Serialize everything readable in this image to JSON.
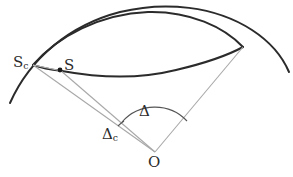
{
  "figure": {
    "background_color": "#ffffff",
    "width": 293,
    "height": 177,
    "colors": {
      "dark_stroke": "#2b2b2b",
      "light_stroke": "#a8a8a8",
      "label_color": "#2b2b2b",
      "point_fill": "#1a1a1a"
    },
    "labels": {
      "source_corrected": {
        "base": "S",
        "sub": "c",
        "name": "S_c"
      },
      "source": {
        "base": "S",
        "sub": "",
        "name": "S"
      },
      "origin": {
        "base": "O",
        "sub": "",
        "name": "O"
      },
      "angle_delta": {
        "base": "Δ",
        "sub": "",
        "name": "Delta"
      },
      "angle_delta_c": {
        "base": "Δ",
        "sub": "c",
        "name": "Delta_c"
      }
    },
    "points": [
      {
        "name": "S",
        "x": 60,
        "y": 70
      },
      {
        "name": "O",
        "x": 155,
        "y": 152
      },
      {
        "name": "S_c",
        "x": 33,
        "y": 65
      },
      {
        "name": "R",
        "x": 243,
        "y": 47
      }
    ],
    "geometry": {
      "big_arc": "large circle arc spanning left to right across the upper field",
      "lens_upper_arc": "upper boundary of lens (vesica) shape",
      "lens_lower_arc": "lower boundary of lens passing through point S",
      "ray_to_Sc": "light ray from O to S_c",
      "ray_to_S": "light ray from O to S",
      "ray_to_right": "light ray from O to right arc intersection",
      "angle_arc_delta": "arc marking angle Delta at O",
      "angle_arc_delta_c": "arc marking angle Delta_c at O"
    }
  }
}
